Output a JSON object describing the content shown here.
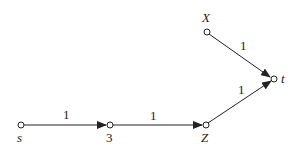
{
  "diagram": {
    "type": "directed-graph",
    "colors": {
      "stroke": "#222222",
      "background": "#ffffff"
    },
    "nodes": [
      {
        "id": "s",
        "label": "s",
        "italic": true
      },
      {
        "id": "3",
        "label": "3",
        "italic": false
      },
      {
        "id": "Z",
        "label": "Z",
        "italic": true
      },
      {
        "id": "t",
        "label": "t",
        "italic": true
      },
      {
        "id": "X",
        "label": "X",
        "italic": true
      }
    ],
    "edges": [
      {
        "from": "s",
        "to": "3",
        "weight": "1"
      },
      {
        "from": "3",
        "to": "Z",
        "weight": "1"
      },
      {
        "from": "Z",
        "to": "t",
        "weight": "1"
      },
      {
        "from": "X",
        "to": "t",
        "weight": "1"
      }
    ]
  }
}
